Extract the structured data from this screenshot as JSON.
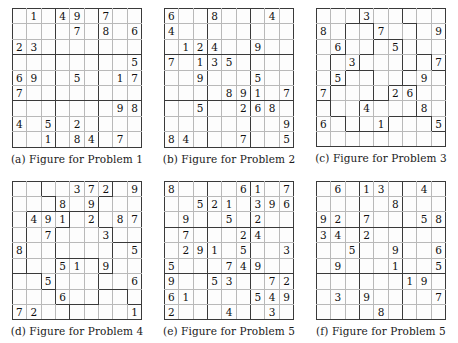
{
  "figures": [
    {
      "id": "figure-problem-1",
      "caption": "(a) Figure for Problem 1",
      "type": "classic-sudoku",
      "size": 9,
      "cells": [
        [
          "",
          "1",
          "",
          "4",
          "9",
          "",
          "7",
          "",
          ""
        ],
        [
          "",
          "",
          "",
          "",
          "7",
          "",
          "8",
          "",
          "6"
        ],
        [
          "2",
          "3",
          "",
          "",
          "",
          "",
          "",
          "",
          ""
        ],
        [
          "",
          "",
          "",
          "",
          "",
          "",
          "",
          "",
          "5"
        ],
        [
          "6",
          "9",
          "",
          "",
          "5",
          "",
          "",
          "1",
          "7"
        ],
        [
          "7",
          "",
          "",
          "",
          "",
          "",
          "",
          "",
          ""
        ],
        [
          "",
          "",
          "",
          "",
          "",
          "",
          "",
          "9",
          "8"
        ],
        [
          "4",
          "",
          "5",
          "",
          "2",
          "",
          "",
          "",
          ""
        ],
        [
          "",
          "",
          "1",
          "",
          "8",
          "4",
          "",
          "7",
          ""
        ]
      ]
    },
    {
      "id": "figure-problem-2",
      "caption": "(b) Figure for Problem 2",
      "type": "classic-sudoku",
      "size": 9,
      "cells": [
        [
          "6",
          "",
          "",
          "8",
          "",
          "",
          "",
          "4",
          ""
        ],
        [
          "4",
          "",
          "",
          "",
          "",
          "",
          "",
          "",
          ""
        ],
        [
          "",
          "1",
          "2",
          "4",
          "",
          "",
          "9",
          "",
          ""
        ],
        [
          "7",
          "",
          "1",
          "3",
          "5",
          "",
          "",
          "",
          ""
        ],
        [
          "",
          "",
          "9",
          "",
          "",
          "",
          "5",
          "",
          ""
        ],
        [
          "",
          "",
          "",
          "",
          "8",
          "9",
          "1",
          "",
          "7"
        ],
        [
          "",
          "",
          "5",
          "",
          "",
          "2",
          "6",
          "8",
          ""
        ],
        [
          "",
          "",
          "",
          "",
          "",
          "",
          "",
          "",
          "9"
        ],
        [
          "8",
          "4",
          "",
          "",
          "",
          "7",
          "",
          "",
          "5"
        ]
      ]
    },
    {
      "id": "figure-problem-3",
      "caption": "(c) Figure for Problem 3",
      "type": "jigsaw-sudoku",
      "size": 9,
      "cells": [
        [
          "",
          "",
          "",
          "3",
          "",
          "",
          "",
          "",
          ""
        ],
        [
          "8",
          "",
          "",
          "",
          "7",
          "",
          "",
          "",
          "9"
        ],
        [
          "",
          "6",
          "",
          "",
          "",
          "5",
          "",
          "",
          ""
        ],
        [
          "",
          "",
          "3",
          "",
          "",
          "",
          "",
          "",
          "7"
        ],
        [
          "",
          "5",
          "",
          "",
          "",
          "",
          "",
          "9",
          ""
        ],
        [
          "7",
          "",
          "",
          "",
          "",
          "2",
          "6",
          "",
          ""
        ],
        [
          "",
          "",
          "",
          "4",
          "",
          "",
          "",
          "8",
          ""
        ],
        [
          "6",
          "",
          "",
          "",
          "1",
          "",
          "",
          "",
          "5"
        ],
        [
          "",
          "",
          "",
          "",
          "",
          "",
          "",
          "",
          ""
        ]
      ],
      "regions": [
        [
          0,
          0,
          0,
          1,
          1,
          1,
          2,
          2,
          2
        ],
        [
          0,
          0,
          3,
          3,
          1,
          1,
          1,
          2,
          2
        ],
        [
          0,
          0,
          3,
          3,
          4,
          4,
          1,
          2,
          2
        ],
        [
          0,
          3,
          3,
          4,
          4,
          4,
          1,
          5,
          2
        ],
        [
          0,
          3,
          6,
          6,
          4,
          4,
          5,
          5,
          5
        ],
        [
          0,
          6,
          6,
          6,
          4,
          7,
          7,
          5,
          5
        ],
        [
          8,
          6,
          6,
          7,
          7,
          7,
          7,
          5,
          5
        ],
        [
          8,
          8,
          6,
          7,
          7,
          8,
          8,
          8,
          5
        ],
        [
          8,
          8,
          8,
          8,
          8,
          8,
          8,
          8,
          8
        ]
      ]
    },
    {
      "id": "figure-problem-4",
      "caption": "(d) Figure for Problem 4",
      "type": "jigsaw-sudoku",
      "size": 9,
      "cells": [
        [
          "",
          "",
          "",
          "",
          "3",
          "7",
          "2",
          "",
          "9"
        ],
        [
          "",
          "",
          "",
          "8",
          "",
          "9",
          "",
          "",
          ""
        ],
        [
          "",
          "4",
          "9",
          "1",
          "",
          "2",
          "",
          "8",
          "7"
        ],
        [
          "",
          "",
          "7",
          "",
          "",
          "",
          "3",
          "",
          ""
        ],
        [
          "8",
          "",
          "",
          "",
          "",
          "",
          "",
          "",
          "5"
        ],
        [
          "",
          "",
          "",
          "5",
          "1",
          "",
          "9",
          "",
          ""
        ],
        [
          "",
          "",
          "5",
          "",
          "",
          "",
          "",
          "",
          "6"
        ],
        [
          "",
          "",
          "",
          "6",
          "",
          "",
          "",
          "",
          ""
        ],
        [
          "7",
          "2",
          "",
          "",
          "",
          "",
          "",
          "",
          "1"
        ]
      ],
      "regions": [
        [
          0,
          0,
          1,
          1,
          1,
          1,
          1,
          2,
          2
        ],
        [
          0,
          0,
          0,
          1,
          1,
          1,
          2,
          2,
          2
        ],
        [
          0,
          3,
          3,
          3,
          4,
          4,
          2,
          2,
          2
        ],
        [
          0,
          3,
          3,
          4,
          4,
          4,
          4,
          2,
          2
        ],
        [
          0,
          3,
          3,
          4,
          4,
          4,
          4,
          5,
          5
        ],
        [
          0,
          3,
          3,
          6,
          6,
          6,
          4,
          5,
          5
        ],
        [
          7,
          7,
          3,
          6,
          6,
          6,
          5,
          5,
          5
        ],
        [
          7,
          7,
          7,
          6,
          6,
          6,
          8,
          8,
          5
        ],
        [
          7,
          7,
          7,
          7,
          8,
          8,
          8,
          8,
          8
        ]
      ]
    },
    {
      "id": "figure-problem-5",
      "caption": "(e) Figure for Problem 5",
      "type": "classic-sudoku",
      "size": 9,
      "cells": [
        [
          "8",
          "",
          "",
          "",
          "",
          "6",
          "1",
          "",
          "7"
        ],
        [
          "",
          "",
          "5",
          "2",
          "1",
          "",
          "3",
          "9",
          "6"
        ],
        [
          "",
          "9",
          "",
          "",
          "5",
          "",
          "2",
          "",
          ""
        ],
        [
          "",
          "7",
          "",
          "",
          "",
          "2",
          "4",
          "",
          ""
        ],
        [
          "",
          "2",
          "9",
          "1",
          "",
          "5",
          "",
          "",
          "3"
        ],
        [
          "5",
          "",
          "",
          "",
          "7",
          "4",
          "9",
          "",
          ""
        ],
        [
          "9",
          "",
          "",
          "5",
          "3",
          "",
          "",
          "7",
          "2"
        ],
        [
          "6",
          "1",
          "",
          "",
          "",
          "",
          "5",
          "4",
          "9"
        ],
        [
          "2",
          "",
          "",
          "",
          "4",
          "",
          "",
          "3",
          ""
        ]
      ]
    },
    {
      "id": "figure-problem-5-f",
      "caption": "(f) Figure for Problem 5",
      "type": "classic-sudoku",
      "size": 9,
      "cells": [
        [
          "",
          "6",
          "",
          "1",
          "3",
          "",
          "",
          "4",
          ""
        ],
        [
          "",
          "",
          "",
          "",
          "",
          "8",
          "",
          "",
          ""
        ],
        [
          "9",
          "2",
          "",
          "7",
          "",
          "",
          "",
          "5",
          "8"
        ],
        [
          "3",
          "4",
          "",
          "2",
          "",
          "",
          "",
          "",
          ""
        ],
        [
          "",
          "",
          "5",
          "",
          "",
          "9",
          "",
          "",
          "6"
        ],
        [
          "",
          "9",
          "",
          "",
          "",
          "1",
          "",
          "",
          "5"
        ],
        [
          "",
          "",
          "",
          "",
          "",
          "",
          "1",
          "9",
          ""
        ],
        [
          "",
          "3",
          "",
          "9",
          "",
          "",
          "",
          "",
          "7"
        ],
        [
          "",
          "",
          "",
          "",
          "8",
          "",
          "",
          "",
          ""
        ]
      ]
    }
  ]
}
